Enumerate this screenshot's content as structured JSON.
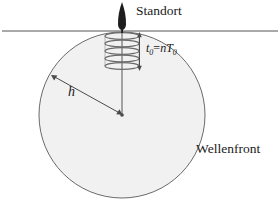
{
  "diagram": {
    "title_label": "Standort",
    "wavefront_label": "Wellenfront",
    "height_label": "h",
    "formula": {
      "t_symbol": "t",
      "t_sub": "0",
      "equals": "=",
      "n_symbol": "n",
      "T_symbol": "T",
      "T_sub": "0",
      "full": "t0=nT0"
    },
    "icons": {
      "location_marker": "location-spike-icon",
      "wave_coil": "coil-wave-icon",
      "radius_arrow": "double-headed-arrow-icon",
      "duration_arrow": "vertical-double-arrow-icon"
    },
    "geometry": {
      "ground_line_y": 31,
      "circle_center_x": 122,
      "circle_center_y": 115,
      "circle_radius": 83,
      "coil_turns": 5,
      "coil_top_y": 33,
      "coil_bottom_y": 70
    },
    "colors": {
      "stroke": "#555555",
      "ink": "#1a1a1a",
      "circle_fill": "#f1f1f1",
      "background": "#ffffff"
    }
  }
}
